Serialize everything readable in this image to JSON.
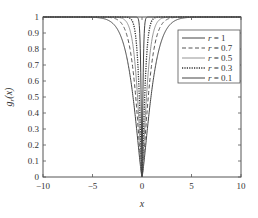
{
  "chart_data": {
    "type": "line",
    "title": "",
    "xlabel": "x",
    "ylabel": "g_r(x)",
    "xlim": [
      -10,
      10
    ],
    "ylim": [
      0,
      1
    ],
    "xticks": [
      -10,
      -5,
      0,
      5,
      10
    ],
    "yticks": [
      0,
      0.1,
      0.2,
      0.3,
      0.4,
      0.5,
      0.6,
      0.7,
      0.8,
      0.9,
      1
    ],
    "xtick_labels": [
      "−10",
      "−5",
      "0",
      "5",
      "10"
    ],
    "ytick_labels": [
      "0",
      "0.1",
      "0.2",
      "0.3",
      "0.4",
      "0.5",
      "0.6",
      "0.7",
      "0.8",
      "0.9",
      "1"
    ],
    "grid": false,
    "legend_position": "upper right",
    "series": [
      {
        "name": "r = 1",
        "style": "solid",
        "width_param": 1.0
      },
      {
        "name": "r = 0.7",
        "style": "dashed",
        "width_param": 0.7
      },
      {
        "name": "r = 0.5",
        "style": "solid-light",
        "width_param": 0.5
      },
      {
        "name": "r = 0.3",
        "style": "dashdot",
        "width_param": 0.3
      },
      {
        "name": "r = 0.1",
        "style": "solid",
        "width_param": 0.1
      }
    ],
    "x_sample": [
      -10,
      -5,
      -3,
      -2,
      -1.5,
      -1,
      -0.5,
      0,
      0.5,
      1,
      1.5,
      2,
      3,
      5,
      10
    ],
    "series_values": {
      "r = 1": [
        1.0,
        0.99,
        0.93,
        0.82,
        0.72,
        0.57,
        0.33,
        0.0,
        0.33,
        0.57,
        0.72,
        0.82,
        0.93,
        0.99,
        1.0
      ],
      "r = 0.7": [
        1.0,
        1.0,
        0.97,
        0.9,
        0.82,
        0.67,
        0.4,
        0.0,
        0.4,
        0.67,
        0.82,
        0.9,
        0.97,
        1.0,
        1.0
      ],
      "r = 0.5": [
        1.0,
        1.0,
        0.99,
        0.96,
        0.91,
        0.78,
        0.5,
        0.0,
        0.5,
        0.78,
        0.91,
        0.96,
        0.99,
        1.0,
        1.0
      ],
      "r = 0.3": [
        1.0,
        1.0,
        1.0,
        0.99,
        0.98,
        0.92,
        0.65,
        0.0,
        0.65,
        0.92,
        0.98,
        0.99,
        1.0,
        1.0,
        1.0
      ],
      "r = 0.1": [
        1.0,
        1.0,
        1.0,
        1.0,
        1.0,
        1.0,
        0.95,
        0.0,
        0.95,
        1.0,
        1.0,
        1.0,
        1.0,
        1.0,
        1.0
      ]
    }
  },
  "legend": {
    "items": [
      {
        "label": "r = 1"
      },
      {
        "label": "r = 0.7"
      },
      {
        "label": "r = 0.5"
      },
      {
        "label": "r = 0.3"
      },
      {
        "label": "r = 0.1"
      }
    ]
  },
  "axes": {
    "xlabel": "x",
    "ylabel": "g_r(x)"
  }
}
